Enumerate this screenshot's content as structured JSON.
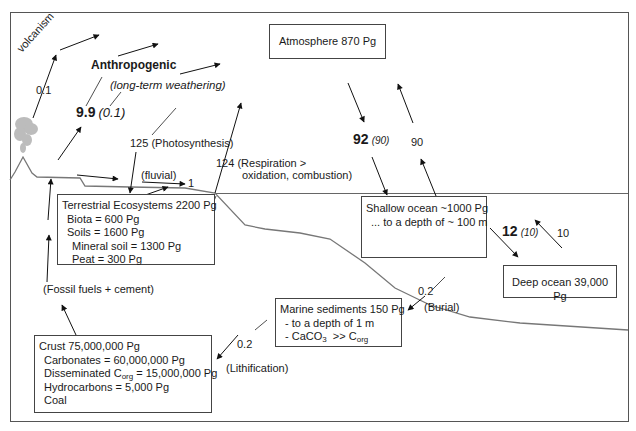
{
  "reservoirs": {
    "atmosphere": {
      "label": "Atmosphere 870 Pg"
    },
    "terrestrial": {
      "title": "Terrestrial Ecosystems 2200 Pg",
      "biota": "Biota = 600 Pg",
      "soils": "Soils = 1600 Pg",
      "mineral_soil": "Mineral soil = 1300 Pg",
      "peat": "Peat = 300 Pg"
    },
    "shallow_ocean": {
      "title": "Shallow ocean ~1000 Pg",
      "depth": "... to a depth of ~ 100 m"
    },
    "deep_ocean": {
      "label": "Deep ocean 39,000 Pg"
    },
    "marine_sediments": {
      "title": "Marine sediments 150 Pg",
      "depth": "- to a depth of 1 m",
      "caco3_prefix": "- CaCO",
      "caco3_sub": "3",
      "caco3_mid": "  >> C",
      "corg_sub": "org"
    },
    "crust": {
      "title": "Crust 75,000,000 Pg",
      "carbonates": "Carbonates = 60,000,000 Pg",
      "disseminated_prefix": "Disseminated C",
      "disseminated_sub": "org",
      "disseminated_value": " = 15,000,000 Pg",
      "hydrocarbons": "Hydrocarbons = 5,000 Pg",
      "coal": "Coal"
    }
  },
  "fluxes": {
    "volcanism": {
      "label": "volcanism",
      "value": "0.1"
    },
    "anthropogenic": {
      "label": "Anthropogenic",
      "sublabel": "(long-term weathering)",
      "value": "9.9",
      "value_paren": "(0.1)"
    },
    "photosynthesis": {
      "label": "125 (Photosynthesis)"
    },
    "respiration": {
      "line1": "124 (Respiration >",
      "line2": "oxidation, combustion)"
    },
    "fluvial": {
      "label": "(fluvial)",
      "value": "1"
    },
    "atm_to_ocean": {
      "value": "92",
      "value_paren": "(90)"
    },
    "ocean_to_atm": {
      "value": "90"
    },
    "shallow_to_deep": {
      "value": "12",
      "value_paren": "(10)"
    },
    "deep_to_shallow": {
      "value": "10"
    },
    "burial": {
      "value": "0.2",
      "label": "(Burial)"
    },
    "lithification": {
      "value": "0.2",
      "label": "(Lithification)"
    },
    "fossil_fuels": {
      "label": "(Fossil fuels + cement)"
    }
  },
  "colors": {
    "line": "#333333",
    "terrain": "#777777",
    "frame": "#555555",
    "plume": "#b0b0b0"
  }
}
